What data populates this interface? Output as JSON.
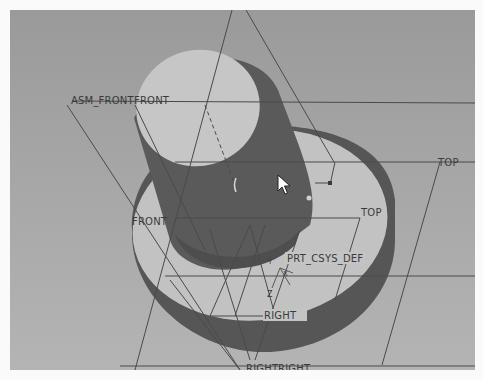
{
  "app": {
    "type": "3D CAD graphics viewport"
  },
  "viewport": {
    "background_top": "#9a9a9a",
    "background_bottom": "#b4b4b4",
    "model_dark": "#555555",
    "model_light": "#c0c0c0",
    "datum_line": "#4a4a4a"
  },
  "datum_labels": {
    "asm_front": "ASM_FRONT",
    "front_a": "FRONT",
    "front_b": "FRONT",
    "top_a": "TOP",
    "top_b": "TOP",
    "csys": "PRT_CSYS_DEF",
    "right_a": "RIGHT",
    "right_b": "RIGHT",
    "right_c": "RIGHT",
    "axis_z": "Z",
    "axis_x": "X",
    "axis_y": "Y"
  },
  "cursor": {
    "type": "arrow-pointer"
  }
}
